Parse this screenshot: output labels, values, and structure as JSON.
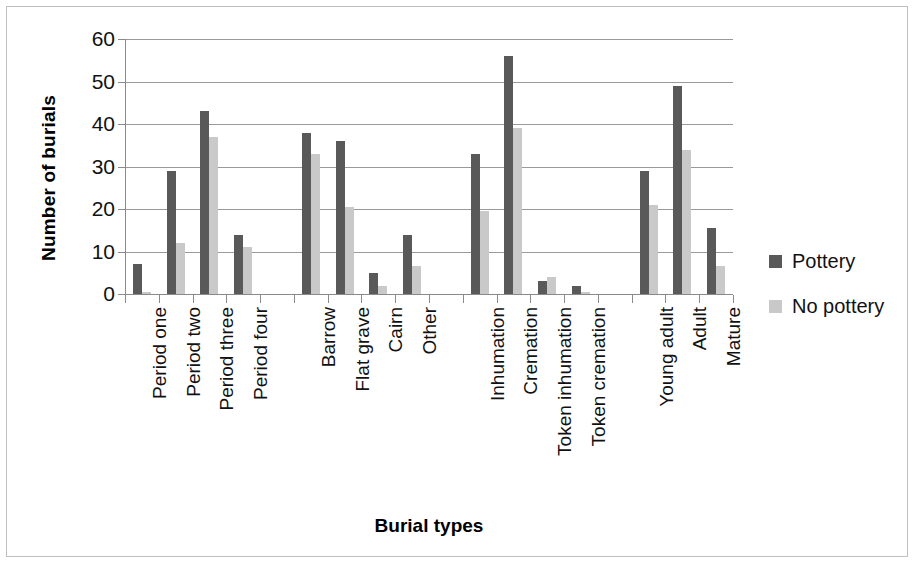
{
  "chart_data": {
    "type": "bar",
    "title": "",
    "xlabel": "Burial types",
    "ylabel": "Number of burials",
    "ylim": [
      0,
      60
    ],
    "ytick_values": [
      60,
      50,
      40,
      30,
      20,
      10,
      0
    ],
    "grid": true,
    "legend_position": "right",
    "categories": [
      "Period one",
      "Period two",
      "Period three",
      "Period four",
      "Barrow",
      "Flat grave",
      "Cairn",
      "Other",
      "Inhumation",
      "Cremation",
      "Token inhumation",
      "Token cremation",
      "Young adult",
      "Adult",
      "Mature"
    ],
    "group_separators_after": [
      "Period four",
      "Other",
      "Token cremation"
    ],
    "series": [
      {
        "name": "Pottery",
        "color": "#595959",
        "values": [
          7,
          29,
          43,
          14,
          38,
          36,
          5,
          14,
          33,
          56,
          3,
          2,
          29,
          49,
          15.5
        ]
      },
      {
        "name": "No pottery",
        "color": "#c9c9c9",
        "values": [
          0.5,
          12,
          37,
          11,
          33,
          20.5,
          2,
          6.5,
          19.5,
          39,
          4,
          0.5,
          21,
          34,
          6.5
        ]
      }
    ]
  },
  "legend": {
    "items": [
      {
        "label": "Pottery",
        "color": "#595959"
      },
      {
        "label": "No pottery",
        "color": "#c9c9c9"
      }
    ]
  },
  "colors": {
    "pottery": "#595959",
    "no_pottery": "#c9c9c9",
    "gridline": "#9a9a9a",
    "frame_border": "#bfbfbf",
    "background": "#ffffff"
  }
}
